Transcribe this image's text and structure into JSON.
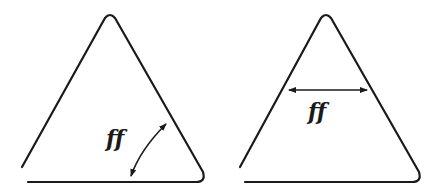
{
  "figures": [
    {
      "id": "left",
      "label": "ff",
      "dimension": "angle",
      "description": "Triangle with curved double-arrow indicating the angle at the bottom-right vertex"
    },
    {
      "id": "right",
      "label": "ff",
      "dimension": "width",
      "description": "Triangle with horizontal double-arrow spanning its width"
    }
  ],
  "colors": {
    "stroke": "#1a1a1a",
    "background": "#ffffff"
  }
}
